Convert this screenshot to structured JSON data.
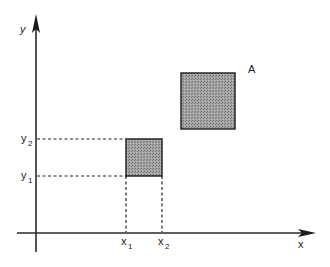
{
  "diagram": {
    "axes": {
      "x_label": "x",
      "y_label": "y"
    },
    "ticks": {
      "x1": {
        "base": "x",
        "sub": "1"
      },
      "x2": {
        "base": "x",
        "sub": "2"
      },
      "y1": {
        "base": "y",
        "sub": "1"
      },
      "y2": {
        "base": "y",
        "sub": "2"
      }
    },
    "rectangles": [
      {
        "name": "small-rectangle",
        "label": "",
        "x1": "x1",
        "x2": "x2",
        "y1": "y1",
        "y2": "y2"
      },
      {
        "name": "rectangle-A",
        "label": "A"
      }
    ],
    "colors": {
      "fill": "#9a9a9a",
      "stroke": "#1a1a1a",
      "axis": "#2a2a2a"
    }
  }
}
